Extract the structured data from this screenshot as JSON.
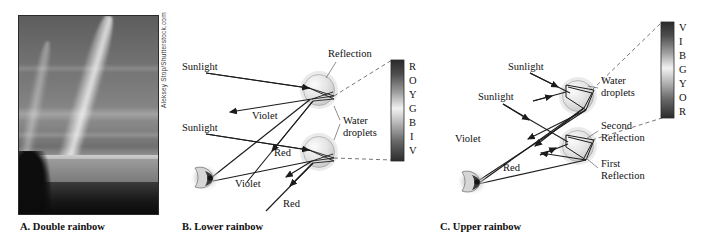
{
  "figure": {
    "background_color": "#ffffff",
    "ray_color": "#1c1c1c",
    "leader_color": "#5d5d5d",
    "dashed_color": "#4a4a4a"
  },
  "panel_a": {
    "caption": "A. Double rainbow",
    "caption_letter": "A.",
    "caption_text": "Double rainbow",
    "photo_credit": "Aleksey Stop/Shutterstock.com",
    "photo_description": "Grayscale photograph of a double rainbow arcing over water with a dark tree-lined foreground",
    "photo_is_grayscale": true
  },
  "panel_b": {
    "caption": "B. Lower rainbow",
    "caption_letter": "B.",
    "caption_text": "Lower rainbow",
    "labels": {
      "sunlight_upper": "Sunlight",
      "sunlight_lower": "Sunlight",
      "reflection": "Reflection",
      "violet_upper": "Violet",
      "violet_lower": "Violet",
      "red_upper": "Red",
      "red_lower": "Red",
      "water_droplets_line1": "Water",
      "water_droplets_line2": "droplets"
    },
    "color_bar": {
      "name": "ROYGBIV spectrum bar",
      "letters": [
        "R",
        "O",
        "Y",
        "G",
        "B",
        "I",
        "V"
      ],
      "order_top_to_bottom": "red at top, violet at bottom",
      "gradient_top_color": "#2b2b2b",
      "gradient_bottom_color": "#2b2b2b",
      "gradient_mid_color": "#f2f2f2"
    },
    "droplet_count": 2,
    "reflection_count": 1
  },
  "panel_c": {
    "caption": "C. Upper rainbow",
    "caption_letter": "C.",
    "caption_text": "Upper rainbow",
    "labels": {
      "sunlight_upper": "Sunlight",
      "sunlight_lower": "Sunlight",
      "violet": "Violet",
      "red": "Red",
      "water_droplets_line1": "Water",
      "water_droplets_line2": "droplets",
      "second_reflection_line1": "Second",
      "second_reflection_line2": "Reflection",
      "first_reflection_line1": "First",
      "first_reflection_line2": "Reflection"
    },
    "color_bar": {
      "name": "VIBGYOR spectrum bar",
      "letters": [
        "V",
        "I",
        "B",
        "G",
        "Y",
        "O",
        "R"
      ],
      "order_top_to_bottom": "violet at top, red at bottom",
      "gradient_top_color": "#2b2b2b",
      "gradient_bottom_color": "#2b2b2b",
      "gradient_mid_color": "#f2f2f2"
    },
    "droplet_count": 2,
    "reflection_count": 2
  }
}
